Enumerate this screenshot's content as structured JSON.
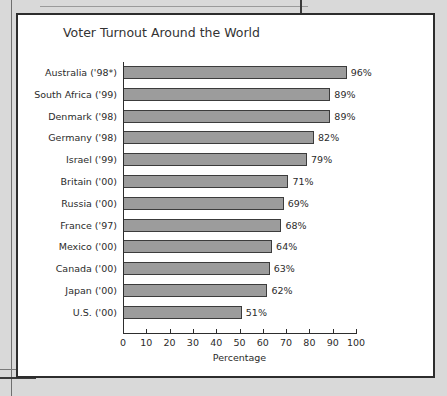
{
  "background": {
    "page_color": "#d9d9d9",
    "figure_color": "#ffffff",
    "border_color": "#2d2d2d",
    "top_stub_text": " "
  },
  "chart_data": {
    "type": "bar",
    "orientation": "horizontal",
    "title": "Voter Turnout Around the World",
    "xlabel": "Percentage",
    "ylabel": "",
    "xlim": [
      0,
      100
    ],
    "xticks": [
      0,
      10,
      20,
      30,
      40,
      50,
      60,
      70,
      80,
      90,
      100
    ],
    "xtick_labels": [
      "0",
      "10",
      "20",
      "30",
      "40",
      "50",
      "60",
      "70",
      "80",
      "90",
      "100"
    ],
    "grid": false,
    "legend": false,
    "bar_color": "#9c9c9c",
    "bar_edge_color": "#3c3c3c",
    "categories": [
      "Australia ('98*)",
      "South Africa ('99)",
      "Denmark ('98)",
      "Germany ('98)",
      "Israel ('99)",
      "Britain ('00)",
      "Russia ('00)",
      "France ('97)",
      "Mexico ('00)",
      "Canada ('00)",
      "Japan ('00)",
      "U.S. ('00)"
    ],
    "values": [
      96,
      89,
      89,
      82,
      79,
      71,
      69,
      68,
      64,
      63,
      62,
      51
    ],
    "value_labels": [
      "96%",
      "89%",
      "89%",
      "82%",
      "79%",
      "71%",
      "69%",
      "68%",
      "64%",
      "63%",
      "62%",
      "51%"
    ]
  }
}
